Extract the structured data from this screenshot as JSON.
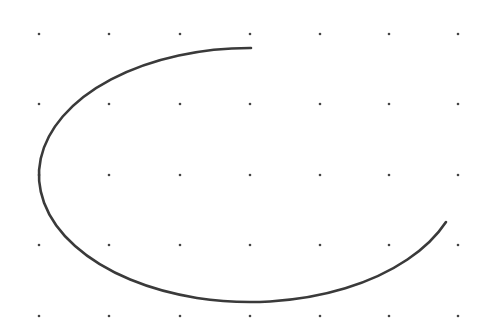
{
  "canvas": {
    "width": 485,
    "height": 335,
    "background": "#ffffff"
  },
  "dot_grid": {
    "xs": [
      39,
      109,
      180,
      250,
      320,
      389,
      458
    ],
    "ys": [
      34,
      104,
      175,
      245,
      316
    ],
    "radius": 1.3,
    "color": "#444444"
  },
  "arc": {
    "center": [
      250,
      175
    ],
    "rx": 211,
    "ry": 127,
    "start": [
      251,
      48
    ],
    "end": [
      446,
      222
    ],
    "stroke": "#3a3a3a",
    "stroke_width": 2.6,
    "direction": "counterclockwise from top through left and bottom to lower-right"
  }
}
